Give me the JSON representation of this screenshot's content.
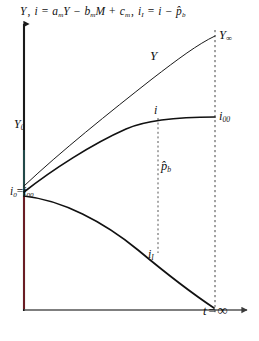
{
  "figure": {
    "title_equation": {
      "full": "Y, i = aₘY − bₘM + cₘ, i₁ = i − p̂ₕ",
      "parts": {
        "y_sym": "Y",
        "comma1": ",",
        "i_sym": "i",
        "eq1": "=",
        "a_coef": "a",
        "a_sub": "m",
        "y2": "Y",
        "minus": "−",
        "b_coef": "b",
        "b_sub": "m",
        "m_sym": "M",
        "plus": "+",
        "c_coef": "c",
        "c_sub": "m",
        "comma2": ",",
        "iI_sym": "i",
        "iI_sub": "I",
        "eq2": "=",
        "i3": "i",
        "minus2": "−",
        "p_hat": "p̂",
        "p_sub": "b"
      }
    },
    "axes": {
      "y_axis_name": "Y, i",
      "x_axis_name": "t",
      "x_axis_end_label": "t = ∞",
      "x_axis_end_parts": {
        "t": "t",
        "eq": "=",
        "inf": "∞"
      },
      "y_axis_color": "#1a1a1a",
      "y_axis_accent_color": "#cc2233",
      "y_axis_accent2_color": "#2e8b8b",
      "x_axis_color": "#555555"
    },
    "labels": {
      "Y0": {
        "base": "Y",
        "sub": "0"
      },
      "i0_i00": {
        "base1": "i",
        "sub1": "0",
        "eq": "=",
        "base2": "i",
        "sub2": "00"
      },
      "Y_inf": {
        "base": "Y",
        "sub": "∞"
      },
      "Y_curve": {
        "base": "Y"
      },
      "i_point": {
        "base": "i"
      },
      "i_inf": {
        "base": "i",
        "sub": "00"
      },
      "p_hat_b": {
        "base": "p̂",
        "sub": "b"
      },
      "i_I": {
        "base": "i",
        "sub": "I"
      }
    },
    "curves": [
      {
        "name": "Y-curve",
        "label": "Y",
        "shape": "concave-increasing",
        "start": {
          "x": 24,
          "y": 186
        },
        "end": {
          "x": 215,
          "y": 36
        },
        "end_label": "Y∞",
        "color": "#1a1a1a",
        "width": 1.0
      },
      {
        "name": "i-curve",
        "label": "i",
        "shape": "concave-increasing",
        "start": {
          "x": 24,
          "y": 192
        },
        "end": {
          "x": 215,
          "y": 118
        },
        "end_label": "i00",
        "color": "#111111",
        "width": 1.7
      },
      {
        "name": "iI-curve",
        "label": "iI",
        "shape": "concave-decreasing",
        "start": {
          "x": 24,
          "y": 196
        },
        "end": {
          "x": 215,
          "y": 308
        },
        "end_label": "t = ∞",
        "color": "#111111",
        "width": 1.7
      }
    ],
    "dashed_lines": [
      {
        "name": "inner-reference-line",
        "x": 158,
        "y_top": 118,
        "y_bottom": 253,
        "annotation": "p̂b"
      },
      {
        "name": "outer-reference-line",
        "x": 215,
        "y_top": 30,
        "y_bottom": 313,
        "annotation": "t = ∞"
      }
    ],
    "origin": {
      "x": 24,
      "y": 310
    }
  }
}
